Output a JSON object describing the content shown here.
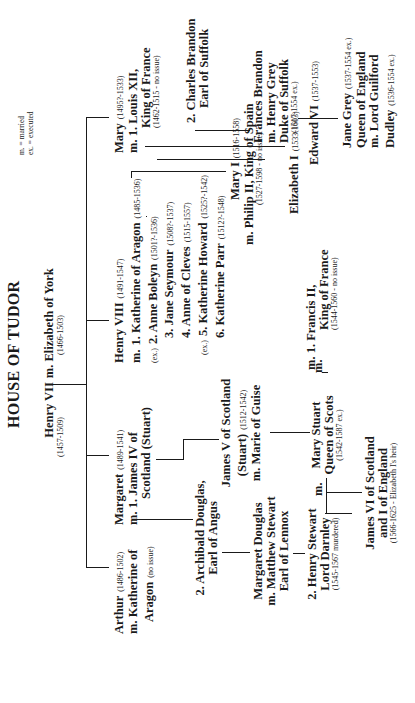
{
  "title": "HOUSE OF TUDOR",
  "legend": {
    "married": "m. = married",
    "executed": "ex. = executed"
  },
  "henry_vii": {
    "name": "Henry VII",
    "dates": "(1457-1509)",
    "marriage": "m. Elizabeth of York",
    "spouse_dates": "(1466-1503)"
  },
  "arthur": {
    "name": "Arthur",
    "dates": "(1486-1502)",
    "line2": "m. Katherine of",
    "line3": "Aragon",
    "note": "(no issue)"
  },
  "margaret": {
    "name": "Margaret",
    "dates": "(1489-1541)",
    "line2": "m.  1. James IV of",
    "line3": "Scotland (Stuart)"
  },
  "archibald": {
    "line1": "2. Archibald Douglas,",
    "line2": "Earl of Angus"
  },
  "margaret_douglas": {
    "line1": "Margaret Douglas",
    "line2": "m. Matthew Stewart",
    "line3": "Earl of Lennox"
  },
  "henry_stewart": {
    "line1": "2. Henry Stewart",
    "line2": "Lord Darnley",
    "dates": "(1545-1567 murdered)"
  },
  "james_v": {
    "line1": "James V of Scotland",
    "line2": "(Stuart)",
    "dates": "(1512-1542)",
    "line3": "m. Marie of Guise"
  },
  "mary_stuart": {
    "line1": "Mary Stuart",
    "line2": "Queen of Scots",
    "dates": "(1542-1587 ex.)",
    "m_left": "m.",
    "m_right": "m."
  },
  "james_vi": {
    "line1": "James VI of Scotland",
    "line2": "and I of England",
    "dates": "(1566-1625 - Elizabeth I's heir)"
  },
  "henry_viii": {
    "name": "Henry VIII",
    "dates": "(1491-1547)",
    "wives": [
      {
        "prefix": "m.",
        "label": "1. Katherine of Aragon",
        "dates": "(1485-1536)"
      },
      {
        "prefix": "(ex.)",
        "label": "2. Anne Boleyn",
        "dates": "(1501?-1536)"
      },
      {
        "prefix": "",
        "label": "3. Jane Seymour",
        "dates": "(1508?-1537)"
      },
      {
        "prefix": "",
        "label": "4. Anne of Cleves",
        "dates": "(1515-1557)"
      },
      {
        "prefix": "(ex.)",
        "label": "5. Katherine Howard",
        "dates": "(1525?-1542)"
      },
      {
        "prefix": "",
        "label": "6. Katherine Parr",
        "dates": "(1512?-1548)"
      }
    ]
  },
  "mary_i": {
    "name": "Mary I",
    "dates": "(1516-1558)",
    "line2": "m. Philip II, King of Spain",
    "spouse_dates": "(1527-1598 - no issue)"
  },
  "elizabeth_i": {
    "name": "Elizabeth I",
    "dates": "(1533-1603)"
  },
  "edward_vi": {
    "name": "Edward VI",
    "dates": "(1537-1553)"
  },
  "francis_ii": {
    "line1": "m.   1. Francis II,",
    "line2": "King of France",
    "dates": "(1544-1560 - no issue)"
  },
  "mary_tudor": {
    "name": "Mary",
    "dates": "(1495?-1533)",
    "line2": "m. 1. Louis XII,",
    "line3": "King of France",
    "spouse_dates": "(1462-1515 - no issue)"
  },
  "charles_brandon": {
    "line1": "2. Charles Brandon",
    "line2": "Earl of Suffolk"
  },
  "frances_brandon": {
    "line1": "Frances Brandon",
    "line2": "m. Henry Grey",
    "line3": "Duke of Suffolk",
    "dates": "(1517-1554 ex.)"
  },
  "jane_grey": {
    "name": "Jane Grey",
    "dates": "(1537-1554 ex.)",
    "line2": "Queen of England",
    "line3": "m. Lord Guilford",
    "line4": "Dudley",
    "spouse_dates": "(1536-1554 ex.)"
  }
}
